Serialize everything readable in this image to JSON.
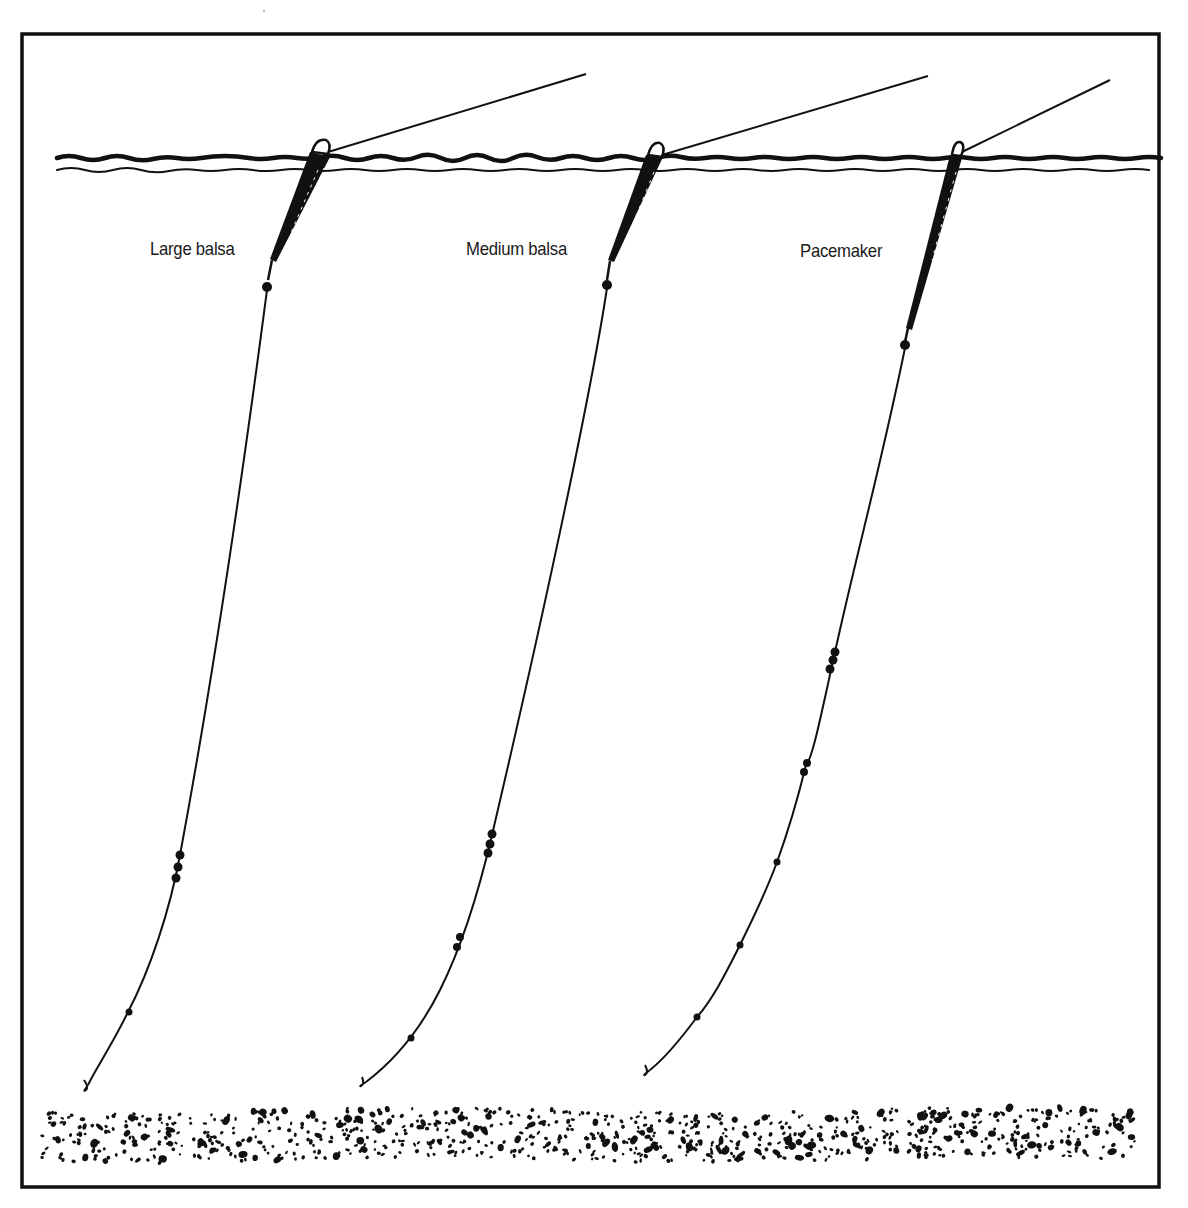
{
  "diagram": {
    "type": "fishing float rig illustration",
    "colors": {
      "ink": "#111111",
      "background": "#ffffff"
    },
    "elements": {
      "frame": "rectangular border",
      "water_surface": "double wavy line",
      "lake_bed": "speckled gravel band"
    },
    "rigs": [
      {
        "label": "Large balsa",
        "float": "large balsa float",
        "shot_groups": [
          "bulk shot (3)",
          "single dropper shot"
        ]
      },
      {
        "label": "Medium balsa",
        "float": "medium balsa float",
        "shot_groups": [
          "bulk shot (3)",
          "pair of shot",
          "single dropper shot"
        ]
      },
      {
        "label": "Pacemaker",
        "float": "pacemaker float",
        "shot_groups": [
          "bulk shot (3)",
          "pair of shot",
          "single shot",
          "single shot",
          "single dropper shot"
        ]
      }
    ]
  }
}
